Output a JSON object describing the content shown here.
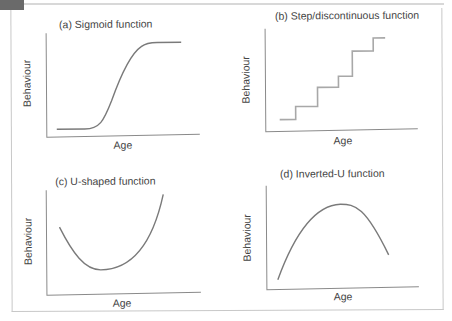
{
  "figure": {
    "panels": [
      {
        "id": "a",
        "title": "(a) Sigmoid function",
        "xlabel": "Age",
        "ylabel": "Behaviour",
        "shape": "sigmoid"
      },
      {
        "id": "b",
        "title": "(b) Step/discontinuous function",
        "xlabel": "Age",
        "ylabel": "Behaviour",
        "shape": "step"
      },
      {
        "id": "c",
        "title": "(c) U-shaped function",
        "xlabel": "Age",
        "ylabel": "Behaviour",
        "shape": "u"
      },
      {
        "id": "d",
        "title": "(d) Inverted-U function",
        "xlabel": "Age",
        "ylabel": "Behaviour",
        "shape": "inverted-u"
      }
    ]
  },
  "colors": {
    "curve": "#7a7a7a",
    "step": "#a8a8a8",
    "axis": "#8a8a8a",
    "text": "#444444",
    "corner_tab": "#6a6a6a"
  }
}
